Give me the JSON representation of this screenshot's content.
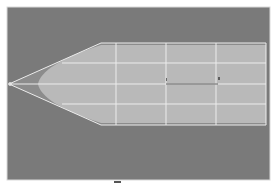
{
  "figure": {
    "background_color": "#ffffff",
    "panel": {
      "x": 7,
      "y": 7,
      "width": 263,
      "height": 173,
      "fill": "#7a7a7a",
      "border": "#d9d9d9"
    },
    "shape": {
      "fill_outer": "#8c8c8c",
      "fill_inner": "#b9b9b9",
      "line_color": "#ececec",
      "dark_line_color": "#5e5e5e",
      "tip": [
        9,
        84
      ],
      "top_left": [
        101,
        43
      ],
      "bottom_left": [
        101,
        125
      ],
      "rect": {
        "x": 101,
        "y": 43,
        "width": 165,
        "height": 82
      },
      "vertical_lines_x": [
        116,
        166,
        216,
        266
      ],
      "horizontal_lines_y": [
        43,
        63,
        84,
        104,
        125
      ],
      "dark_segment": {
        "x1": 166,
        "x2": 218,
        "y": 84
      }
    }
  },
  "caption": {
    "text": ""
  }
}
